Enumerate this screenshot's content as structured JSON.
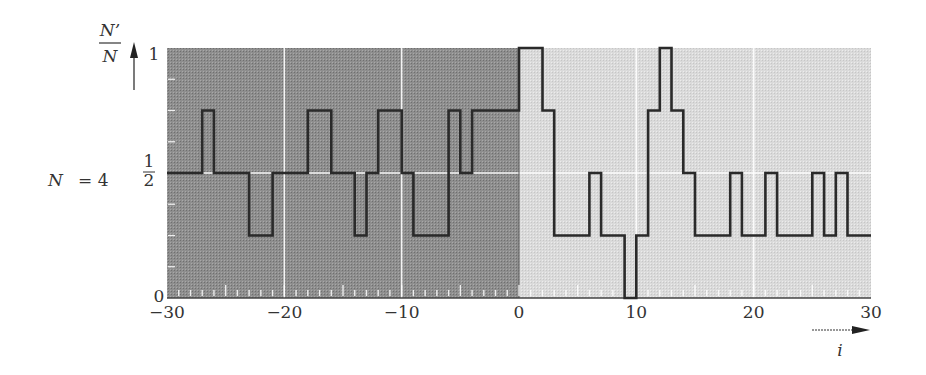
{
  "chart_data": {
    "type": "line",
    "subtype": "step",
    "title": "",
    "xlabel": "i",
    "ylabel": "N'/N",
    "ylabel_numerator": "N'",
    "ylabel_denominator": "N",
    "annotation": "N = 4",
    "xlim": [
      -30,
      30
    ],
    "ylim": [
      0,
      1
    ],
    "x_ticks": [
      -30,
      -20,
      -10,
      0,
      10,
      20,
      30
    ],
    "x_tick_labels": [
      "−30",
      "−20",
      "−10",
      "0",
      "10",
      "20",
      "30"
    ],
    "y_ticks": [
      0,
      0.5,
      1
    ],
    "y_tick_labels": [
      "0",
      "1/2",
      "1"
    ],
    "grid": true,
    "legend": null,
    "regions": [
      {
        "name": "left",
        "x_range": [
          -30,
          0
        ],
        "color": "#8c8c8c"
      },
      {
        "name": "right",
        "x_range": [
          0,
          30
        ],
        "color": "#d9d9d9"
      }
    ],
    "line_color": "#2a2a2a",
    "series": [
      {
        "name": "N'/N",
        "steps": [
          {
            "x0": -30,
            "x1": -27,
            "y": 0.5
          },
          {
            "x0": -27,
            "x1": -26,
            "y": 0.75
          },
          {
            "x0": -26,
            "x1": -23,
            "y": 0.5
          },
          {
            "x0": -23,
            "x1": -21,
            "y": 0.25
          },
          {
            "x0": -21,
            "x1": -18,
            "y": 0.5
          },
          {
            "x0": -18,
            "x1": -16,
            "y": 0.75
          },
          {
            "x0": -16,
            "x1": -14,
            "y": 0.5
          },
          {
            "x0": -14,
            "x1": -13,
            "y": 0.25
          },
          {
            "x0": -13,
            "x1": -12,
            "y": 0.5
          },
          {
            "x0": -12,
            "x1": -10,
            "y": 0.75
          },
          {
            "x0": -10,
            "x1": -9,
            "y": 0.5
          },
          {
            "x0": -9,
            "x1": -6,
            "y": 0.25
          },
          {
            "x0": -6,
            "x1": -5,
            "y": 0.75
          },
          {
            "x0": -5,
            "x1": -4,
            "y": 0.5
          },
          {
            "x0": -4,
            "x1": 0,
            "y": 0.75
          },
          {
            "x0": 0,
            "x1": 2,
            "y": 1.0
          },
          {
            "x0": 2,
            "x1": 3,
            "y": 0.75
          },
          {
            "x0": 3,
            "x1": 6,
            "y": 0.25
          },
          {
            "x0": 6,
            "x1": 7,
            "y": 0.5
          },
          {
            "x0": 7,
            "x1": 9,
            "y": 0.25
          },
          {
            "x0": 9,
            "x1": 10,
            "y": 0.0
          },
          {
            "x0": 10,
            "x1": 11,
            "y": 0.25
          },
          {
            "x0": 11,
            "x1": 12,
            "y": 0.75
          },
          {
            "x0": 12,
            "x1": 13,
            "y": 1.0
          },
          {
            "x0": 13,
            "x1": 14,
            "y": 0.75
          },
          {
            "x0": 14,
            "x1": 15,
            "y": 0.5
          },
          {
            "x0": 15,
            "x1": 18,
            "y": 0.25
          },
          {
            "x0": 18,
            "x1": 19,
            "y": 0.5
          },
          {
            "x0": 19,
            "x1": 21,
            "y": 0.25
          },
          {
            "x0": 21,
            "x1": 22,
            "y": 0.5
          },
          {
            "x0": 22,
            "x1": 25,
            "y": 0.25
          },
          {
            "x0": 25,
            "x1": 26,
            "y": 0.5
          },
          {
            "x0": 26,
            "x1": 27,
            "y": 0.25
          },
          {
            "x0": 27,
            "x1": 28,
            "y": 0.5
          },
          {
            "x0": 28,
            "x1": 30,
            "y": 0.25
          }
        ]
      }
    ]
  },
  "labels": {
    "y_numerator": "N’",
    "y_denominator": "N",
    "y_top": "1",
    "y_half_num": "1",
    "y_half_den": "2",
    "y_zero": "0",
    "annotation_n": "N",
    "annotation_eq": "= 4",
    "x_axis_var": "i"
  }
}
